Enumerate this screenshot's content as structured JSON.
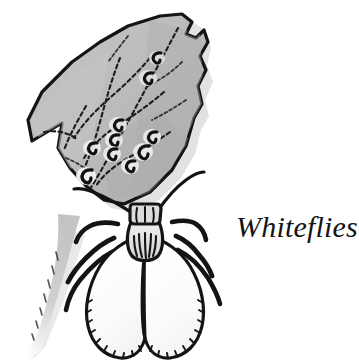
{
  "figure": {
    "caption": "Whiteflies",
    "background_color": "#ffffff",
    "ink_color": "#141414",
    "leaf": {
      "name": "leaf",
      "fill_color": "#b9b9b9",
      "fill_color_light": "#c8c8c8",
      "fill_color_dark": "#a6a6a6",
      "outline_color": "#141414",
      "shadow_color": "#c9c9c9",
      "vein_count": 7,
      "nymph_count": 10,
      "nymph_label": "whitefly-nymph"
    },
    "insect": {
      "name": "adult-whitefly",
      "body_fill": "#fbfbfb",
      "wing_fill": "#fcfcfc",
      "thorax_fill": "#e9e9e9",
      "head_fill": "#dcdcdc",
      "outline_color": "#141414",
      "wing_count": 2,
      "leg_count": 6,
      "antenna_count": 2
    }
  }
}
